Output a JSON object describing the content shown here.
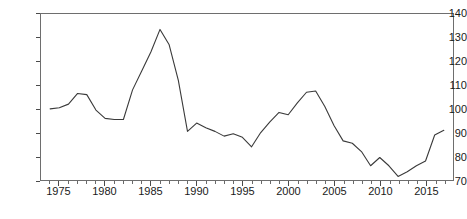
{
  "chart_data": {
    "type": "line",
    "title": "",
    "subtitle": "",
    "xlabel": "",
    "ylabel": "",
    "xlim": [
      1973.0,
      1918.0
    ],
    "ylim": [
      70,
      140
    ],
    "grid": false,
    "legend": null,
    "legend_position": "none",
    "annotations": [],
    "line_color": "#3a3a3a",
    "axis_color": "#6e6e6e",
    "ytick_labels": [
      "140",
      "130",
      "120",
      "110",
      "100",
      "90",
      "80",
      "70"
    ],
    "ytick_values": [
      140,
      130,
      120,
      110,
      100,
      90,
      80,
      70
    ],
    "xtick_labels": [
      "1975",
      "1980",
      "1985",
      "1990",
      "1995",
      "2000",
      "2005",
      "2010",
      "2015"
    ],
    "xtick_values": [
      1975,
      1980,
      1985,
      1990,
      1995,
      2000,
      2005,
      2010,
      2015
    ],
    "x_minor_step": 1,
    "x": [
      1974,
      1975,
      1976,
      1977,
      1978,
      1979,
      1980,
      1981,
      1982,
      1983,
      1984,
      1985,
      1986,
      1987,
      1988,
      1989,
      1990,
      1991,
      1992,
      1993,
      1994,
      1995,
      1996,
      1997,
      1998,
      1999,
      2000,
      2001,
      2002,
      2003,
      2004,
      2005,
      2006,
      2007,
      2008,
      2009,
      2010,
      2011,
      2012,
      2013,
      2014,
      2015,
      2016,
      2017
    ],
    "values": [
      100.0,
      100.5,
      102.0,
      106.5,
      106.0,
      99.5,
      96.0,
      95.5,
      95.5,
      108.0,
      116.0,
      124.0,
      133.5,
      127.0,
      112.0,
      90.5,
      94.0,
      92.0,
      90.5,
      88.5,
      89.5,
      88.0,
      84.0,
      90.0,
      94.5,
      98.5,
      97.5,
      102.5,
      107.0,
      107.5,
      101.0,
      93.0,
      86.5,
      85.5,
      82.0,
      76.0,
      79.5,
      76.0,
      71.5,
      73.5,
      76.0,
      78.0,
      89.0,
      91.0
    ],
    "series": [
      {
        "name": "series-1",
        "values": [
          100.0,
          100.5,
          102.0,
          106.5,
          106.0,
          99.5,
          96.0,
          95.5,
          95.5,
          108.0,
          116.0,
          124.0,
          133.5,
          127.0,
          112.0,
          90.5,
          94.0,
          92.0,
          90.5,
          88.5,
          89.5,
          88.0,
          84.0,
          90.0,
          94.5,
          98.5,
          97.5,
          102.5,
          107.0,
          107.5,
          101.0,
          93.0,
          86.5,
          85.5,
          82.0,
          76.0,
          79.5,
          76.0,
          71.5,
          73.5,
          76.0,
          78.0,
          89.0,
          91.0
        ]
      }
    ]
  }
}
